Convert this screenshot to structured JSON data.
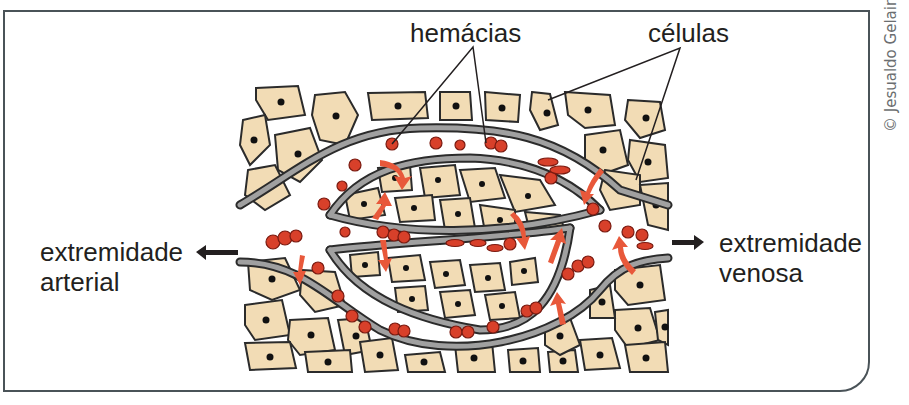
{
  "diagram": {
    "labels": {
      "hemacias": "hemácias",
      "celulas": "células",
      "arterial_line1": "extremidade",
      "arterial_line2": "arterial",
      "venosa_line1": "extremidade",
      "venosa_line2": "venosa"
    },
    "credit": "© Jesualdo Gelain",
    "colors": {
      "cell_fill": "#f2dcb5",
      "cell_border": "#2b2b2b",
      "nucleus": "#111111",
      "vessel_wall": "#9a9a9a",
      "red_blood_cell": "#d8402a",
      "flow_arrow": "#e8583a",
      "frame": "#4a5358",
      "text": "#231f20"
    },
    "arrows": {
      "left": "←",
      "right": "→"
    }
  }
}
